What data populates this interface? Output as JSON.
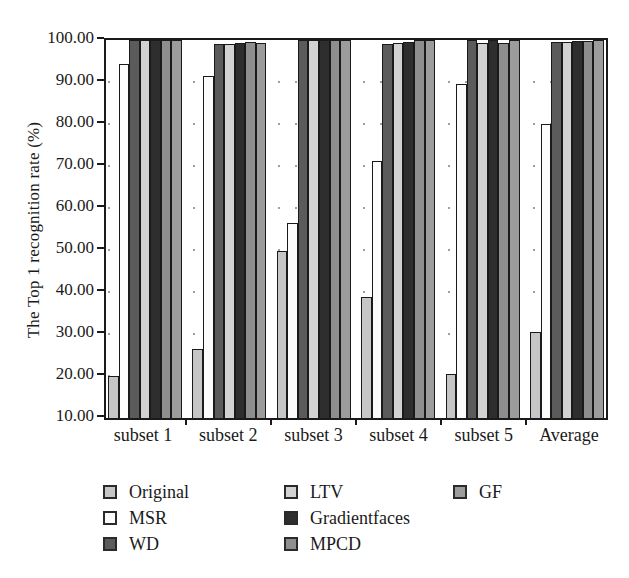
{
  "chart_data": {
    "type": "bar",
    "title": "",
    "ylabel": "The Top 1 recognition rate (%)",
    "xlabel": "",
    "ylim": [
      10,
      100
    ],
    "ytick_step": 10,
    "ytick_labels": [
      "10.00",
      "20.00",
      "30.00",
      "40.00",
      "50.00",
      "60.00",
      "70.00",
      "80.00",
      "90.00",
      "100.00"
    ],
    "categories": [
      "subset 1",
      "subset 2",
      "subset 3",
      "subset 4",
      "subset 5",
      "Average"
    ],
    "series": [
      {
        "name": "Original",
        "color": "#c6c6c6",
        "values": [
          20.0,
          26.5,
          49.8,
          38.9,
          20.4,
          30.5
        ]
      },
      {
        "name": "MSR",
        "color": "#fcfcfc",
        "values": [
          94.3,
          91.5,
          56.4,
          71.2,
          89.5,
          79.9
        ]
      },
      {
        "name": "WD",
        "color": "#5b5b5b",
        "values": [
          100.0,
          99.1,
          100.0,
          99.0,
          100.0,
          99.6
        ]
      },
      {
        "name": "LTV",
        "color": "#d2d2d2",
        "values": [
          100.0,
          99.1,
          100.0,
          99.4,
          99.2,
          99.5
        ]
      },
      {
        "name": "Gradientfaces",
        "color": "#2e2e2e",
        "values": [
          100.0,
          99.2,
          100.0,
          99.6,
          100.0,
          99.8
        ]
      },
      {
        "name": "MPCD",
        "color": "#8e8e8e",
        "values": [
          100.0,
          99.5,
          100.0,
          100.0,
          99.4,
          99.8
        ]
      },
      {
        "name": "GF",
        "color": "#9c9c9c",
        "values": [
          100.0,
          99.4,
          100.0,
          100.0,
          100.0,
          99.9
        ]
      }
    ],
    "grid": "dotted",
    "legend_position": "bottom",
    "legend_columns": [
      [
        "Original",
        "MSR",
        "WD"
      ],
      [
        "LTV",
        "Gradientfaces",
        "MPCD"
      ],
      [
        "GF"
      ]
    ],
    "bar_outline_color": "#1a1a1a",
    "axis_color": "#1a1a1a"
  }
}
